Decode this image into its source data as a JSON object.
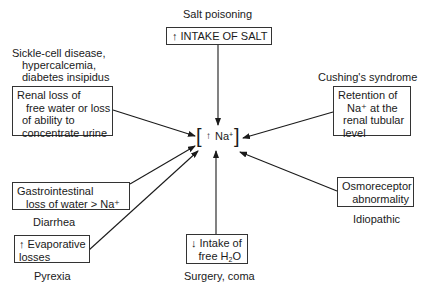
{
  "center": {
    "bracket_open": "[",
    "arrow": "↑",
    "label": "Na",
    "charge": "+",
    "bracket_close": "]"
  },
  "top": {
    "cause": "Salt poisoning",
    "box": "↑ INTAKE OF SALT"
  },
  "upper_left": {
    "causes": [
      "Sickle-cell disease,",
      "hypercalcemia,",
      "diabetes insipidus"
    ],
    "box_lines": [
      "Renal loss of",
      "free water or loss",
      "of ability to",
      "concentrate urine"
    ]
  },
  "upper_right": {
    "cause": "Cushing's syndrome",
    "box_lines": [
      "Retention of",
      "Na⁺ at the",
      "renal tubular",
      "level"
    ]
  },
  "middle_left": {
    "box_lines": [
      "Gastrointestinal",
      "loss of water > Na⁺"
    ],
    "cause": "Diarrhea"
  },
  "lower_left": {
    "box_lines": [
      "↑ Evaporative",
      "losses"
    ],
    "cause": "Pyrexia"
  },
  "bottom": {
    "box_line1": "↓ Intake of",
    "box_line2_prefix": "free H",
    "box_line2_sub": "2",
    "box_line2_suffix": "O",
    "cause": "Surgery, coma"
  },
  "lower_right": {
    "box_lines": [
      "Osmoreceptor",
      "abnormality"
    ],
    "cause": "Idiopathic"
  },
  "colors": {
    "line": "#1a1a1a",
    "box_border": "#333333",
    "background": "#ffffff"
  }
}
